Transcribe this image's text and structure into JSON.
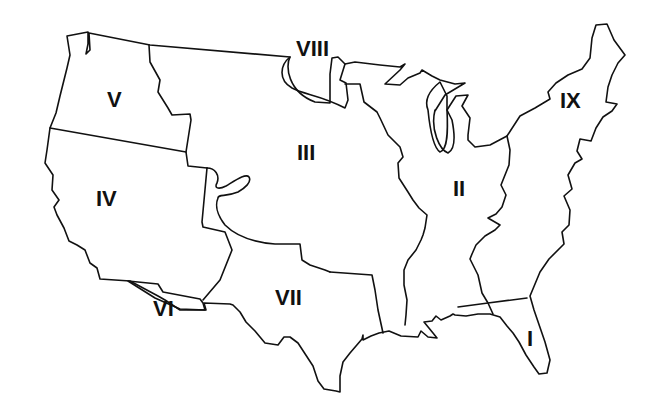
{
  "map": {
    "title": "",
    "regions": [
      {
        "id": "I",
        "label": "I",
        "x": 530,
        "y": 345
      },
      {
        "id": "II",
        "label": "II",
        "x": 463,
        "y": 195
      },
      {
        "id": "III",
        "label": "III",
        "x": 308,
        "y": 158
      },
      {
        "id": "IV",
        "label": "IV",
        "x": 108,
        "y": 205
      },
      {
        "id": "V",
        "label": "V",
        "x": 115,
        "y": 107
      },
      {
        "id": "VI",
        "label": "VI",
        "x": 160,
        "y": 314
      },
      {
        "id": "VII",
        "label": "VII",
        "x": 290,
        "y": 306
      },
      {
        "id": "VIII",
        "label": "VIII",
        "x": 315,
        "y": 52
      },
      {
        "id": "IX",
        "label": "IX",
        "x": 572,
        "y": 108
      }
    ],
    "colors": {
      "stroke": "#111111",
      "background": "#ffffff"
    }
  }
}
